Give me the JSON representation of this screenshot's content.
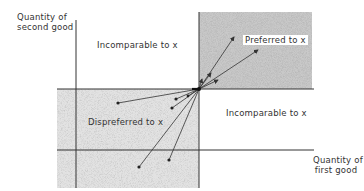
{
  "diagram": {
    "type": "preference-regions",
    "y_axis_label": [
      "Quantity of",
      "second good"
    ],
    "x_axis_label": [
      "Quantity of",
      "first good"
    ],
    "point_label": "x",
    "regions": [
      {
        "id": "preferred",
        "label": "Preferred to x",
        "quadrant": "upper-right",
        "shaded": true
      },
      {
        "id": "incomparable-upper",
        "label": "Incomparable to x",
        "quadrant": "upper-left",
        "shaded": false
      },
      {
        "id": "dispreferred",
        "label": "Dispreferred to x",
        "quadrant": "lower-left",
        "shaded": true
      },
      {
        "id": "incomparable-lower",
        "label": "Incomparable to x",
        "quadrant": "lower-right",
        "shaded": false
      }
    ],
    "colors": {
      "ink": "#333333",
      "shade": "#bdbdbd",
      "background": "#ffffff"
    }
  }
}
